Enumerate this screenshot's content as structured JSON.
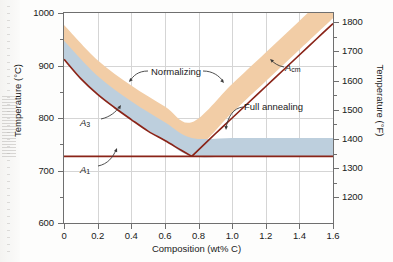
{
  "figure": {
    "name": "iron-carbon-heat-treatment-diagram"
  },
  "axes": {
    "x": {
      "title": "Composition (wt% C)",
      "min": 0,
      "max": 1.6,
      "ticks": [
        "0",
        "0.2",
        "0.4",
        "0.6",
        "0.8",
        "1.0",
        "1.2",
        "1.4",
        "1.6"
      ],
      "tick_values": [
        0,
        0.2,
        0.4,
        0.6,
        0.8,
        1.0,
        1.2,
        1.4,
        1.6
      ]
    },
    "y_left": {
      "title": "Temperature (°C)",
      "min": 600,
      "max": 1000,
      "ticks": [
        "600",
        "700",
        "800",
        "900",
        "1000"
      ],
      "tick_values": [
        600,
        700,
        800,
        900,
        1000
      ],
      "minor_values": [
        650,
        750,
        850,
        950
      ]
    },
    "y_right": {
      "title": "Temperature (°F)",
      "ticks": [
        "1200",
        "1300",
        "1400",
        "1500",
        "1600",
        "1700",
        "1800"
      ],
      "tick_values_f": [
        1200,
        1300,
        1400,
        1500,
        1600,
        1700,
        1800
      ],
      "tick_values_c": [
        648.9,
        704.4,
        760.0,
        815.6,
        871.1,
        926.7,
        982.2
      ],
      "minor_values_f": [
        1250,
        1350,
        1450,
        1550,
        1650,
        1750
      ]
    }
  },
  "annotations": {
    "normalizing": "Normalizing",
    "full_annealing": "Full annealing",
    "a3": "A",
    "a3_sub": "3",
    "a1": "A",
    "a1_sub": "1",
    "acm": "A",
    "acm_sub": "cm"
  },
  "colors": {
    "normalizing_band": "#f2cda6",
    "annealing_band": "#bdcfdd",
    "phase_line": "#8a2418",
    "grid": "#d5d5d5",
    "frame": "#6f6f6f",
    "text": "#1a1a1a"
  },
  "chart_data": {
    "type": "line",
    "title": "",
    "xlabel": "Composition (wt% C)",
    "ylabel": "Temperature (°C)",
    "xlim": [
      0,
      1.6
    ],
    "ylim": [
      600,
      1000
    ],
    "grid": true,
    "legend": "none",
    "series": [
      {
        "name": "A3",
        "note": "austenite/ferrite boundary, hypoeutectoid",
        "x": [
          0.0,
          0.1,
          0.2,
          0.3,
          0.4,
          0.5,
          0.6,
          0.7,
          0.76
        ],
        "values": [
          912,
          875,
          845,
          820,
          797,
          775,
          757,
          738,
          727
        ]
      },
      {
        "name": "Acm",
        "note": "austenite/cementite boundary, hypereutectoid",
        "x": [
          0.76,
          0.9,
          1.0,
          1.1,
          1.2,
          1.3,
          1.4,
          1.5,
          1.6
        ],
        "values": [
          727,
          770,
          800,
          830,
          860,
          890,
          920,
          950,
          980
        ]
      },
      {
        "name": "A1",
        "note": "eutectoid isotherm",
        "x": [
          0.0,
          1.6
        ],
        "values": [
          727,
          727
        ]
      }
    ],
    "bands": [
      {
        "name": "Normalizing",
        "color": "#f2cda6",
        "note": "approximately 55°C above A3 / Acm",
        "lower_offset_C": 10,
        "upper_offset_C": 65,
        "x": [
          0.0,
          0.2,
          0.4,
          0.6,
          0.76,
          1.0,
          1.2,
          1.4,
          1.6
        ],
        "lower": [
          922,
          855,
          807,
          767,
          737,
          810,
          870,
          930,
          990
        ],
        "upper": [
          977,
          910,
          862,
          822,
          792,
          865,
          925,
          985,
          1045
        ]
      },
      {
        "name": "Full annealing",
        "color": "#bdcfdd",
        "note": "approximately 30°C above A3 for hypoeutectoid; 30°C above A1 for hypereutectoid",
        "x": [
          0.0,
          0.2,
          0.4,
          0.6,
          0.76,
          1.0,
          1.2,
          1.4,
          1.6
        ],
        "lower": [
          912,
          845,
          797,
          757,
          727,
          727,
          727,
          727,
          727
        ],
        "upper": [
          947,
          880,
          832,
          792,
          762,
          762,
          762,
          762,
          762
        ]
      }
    ],
    "annotations": [
      {
        "text": "Normalizing",
        "x": 0.62,
        "y": 905
      },
      {
        "text": "Full annealing",
        "x": 1.12,
        "y": 800
      },
      {
        "text": "A3",
        "x": 0.13,
        "y": 800
      },
      {
        "text": "A1",
        "x": 0.13,
        "y": 705
      },
      {
        "text": "Acm",
        "x": 1.27,
        "y": 905
      }
    ]
  }
}
